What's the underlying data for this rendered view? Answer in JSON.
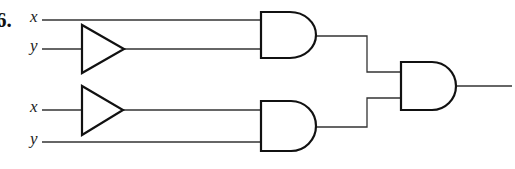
{
  "problem": {
    "number": "6."
  },
  "inputs": [
    {
      "id": "in1",
      "label": "x",
      "y": 20
    },
    {
      "id": "in2",
      "label": "y",
      "y": 49
    },
    {
      "id": "in3",
      "label": "x",
      "y": 110
    },
    {
      "id": "in4",
      "label": "y",
      "y": 142
    }
  ],
  "gates": [
    {
      "id": "buf1",
      "type": "buffer",
      "input": "y (top)"
    },
    {
      "id": "buf2",
      "type": "buffer",
      "input": "x (bottom)"
    },
    {
      "id": "and1",
      "type": "AND",
      "inputs": [
        "x",
        "buffer(y)"
      ]
    },
    {
      "id": "and2",
      "type": "AND",
      "inputs": [
        "buffer(x)",
        "y"
      ]
    },
    {
      "id": "and3",
      "type": "AND",
      "inputs": [
        "and1",
        "and2"
      ]
    }
  ],
  "colors": {
    "stroke": "#111111",
    "wire": "#333333",
    "background": "#ffffff"
  }
}
